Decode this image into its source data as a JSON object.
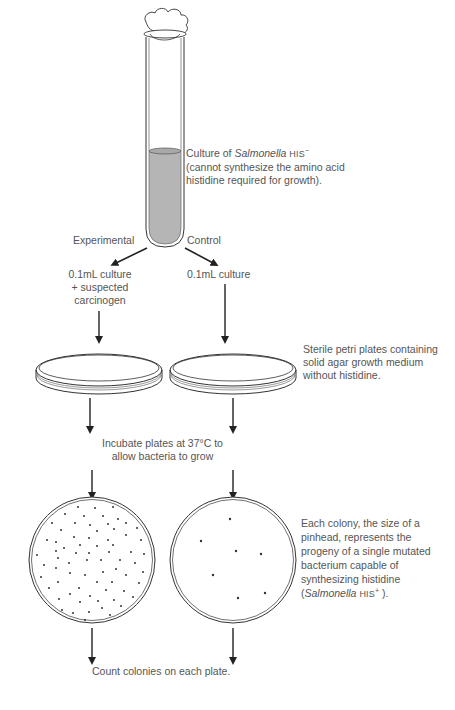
{
  "tube": {
    "label_line1_prefix": "Culture of ",
    "label_line1_species": "Salmonella",
    "label_line1_strain": "HIS",
    "label_line1_sup": "−",
    "label_line2": "(cannot synthesize the amino acid",
    "label_line3": "histidine required for growth)."
  },
  "branches": {
    "experimental": "Experimental",
    "control": "Control"
  },
  "samples": {
    "experimental_line1": "0.1mL culture",
    "experimental_line2": "+ suspected",
    "experimental_line3": "carcinogen",
    "control_line1": "0.1mL culture"
  },
  "plates": {
    "label_line1": "Sterile petri plates containing",
    "label_line2": "solid agar growth medium",
    "label_line3": "without histidine."
  },
  "incubate": {
    "line1": "Incubate plates at 37°C to",
    "line2": "allow bacteria to grow"
  },
  "colonies": {
    "line1": "Each colony, the size of a",
    "line2": "pinhead, represents the",
    "line3": "progeny of a single mutated",
    "line4": "bacterium capable of",
    "line5": "synthesizing histidine",
    "line6_open": "(",
    "line6_species": "Salmonella",
    "line6_strain": "HIS",
    "line6_sup": "+",
    "line6_close": ").",
    "experimental_count_visual": 70,
    "control_count_visual": 7
  },
  "final": {
    "label": "Count colonies on each plate."
  },
  "colors": {
    "ink": "#222222",
    "text": "#555555",
    "liquid": "#b5b5b5"
  }
}
